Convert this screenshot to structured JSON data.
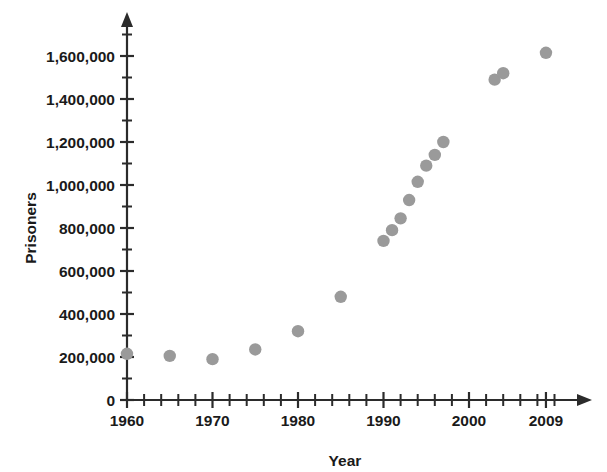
{
  "chart_data": {
    "type": "scatter",
    "title": "",
    "xlabel": "Year",
    "ylabel": "Prisoners",
    "xlim": [
      1960,
      2010
    ],
    "ylim": [
      0,
      1700000
    ],
    "grid": false,
    "legend": "none",
    "marker_color": "#9a9a9a",
    "axis_color": "#2b2b2b",
    "x_tick_labels": [
      "1960",
      "1970",
      "1980",
      "1990",
      "2000",
      "2009"
    ],
    "x_tick_values": [
      1960,
      1970,
      1980,
      1990,
      2000,
      2009
    ],
    "x_minor_tick_step": 2,
    "y_tick_labels": [
      "0",
      "200,000",
      "400,000",
      "600,000",
      "800,000",
      "1,000,000",
      "1,200,000",
      "1,400,000",
      "1,600,000"
    ],
    "y_tick_values": [
      0,
      200000,
      400000,
      600000,
      800000,
      1000000,
      1200000,
      1400000,
      1600000
    ],
    "y_minor_tick_step": 100000,
    "x": [
      1960,
      1965,
      1970,
      1975,
      1980,
      1985,
      1990,
      1991,
      1992,
      1993,
      1994,
      1995,
      1996,
      1997,
      2003,
      2004,
      2009
    ],
    "y": [
      215000,
      205000,
      190000,
      235000,
      320000,
      480000,
      740000,
      790000,
      845000,
      930000,
      1015000,
      1090000,
      1140000,
      1200000,
      1490000,
      1520000,
      1615000
    ],
    "points": [
      {
        "x": 1960,
        "y": 215000
      },
      {
        "x": 1965,
        "y": 205000
      },
      {
        "x": 1970,
        "y": 190000
      },
      {
        "x": 1975,
        "y": 235000
      },
      {
        "x": 1980,
        "y": 320000
      },
      {
        "x": 1985,
        "y": 480000
      },
      {
        "x": 1990,
        "y": 740000
      },
      {
        "x": 1991,
        "y": 790000
      },
      {
        "x": 1992,
        "y": 845000
      },
      {
        "x": 1993,
        "y": 930000
      },
      {
        "x": 1994,
        "y": 1015000
      },
      {
        "x": 1995,
        "y": 1090000
      },
      {
        "x": 1996,
        "y": 1140000
      },
      {
        "x": 1997,
        "y": 1200000
      },
      {
        "x": 2003,
        "y": 1490000
      },
      {
        "x": 2004,
        "y": 1520000
      },
      {
        "x": 2009,
        "y": 1615000
      }
    ]
  }
}
